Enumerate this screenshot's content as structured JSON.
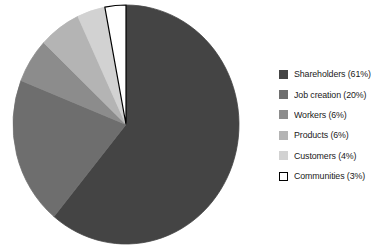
{
  "chart_data": {
    "type": "pie",
    "title": "",
    "subtitle": "",
    "xlabel": "",
    "ylabel": "",
    "legend_position": "right",
    "grid": false,
    "start_angle_deg": 0,
    "direction": "clockwise",
    "categories": [
      "Shareholders",
      "Job creation",
      "Workers",
      "Products",
      "Customers",
      "Communities"
    ],
    "values": [
      61,
      20,
      6,
      6,
      4,
      3
    ],
    "unit": "%",
    "slices": [
      {
        "label": "Shareholders",
        "value": 61,
        "legend_text": "Shareholders (61%)",
        "color": "#444444",
        "outline": "#444444"
      },
      {
        "label": "Job creation",
        "value": 20,
        "legend_text": "Job creation (20%)",
        "color": "#6e6e6e",
        "outline": "#6e6e6e"
      },
      {
        "label": "Workers",
        "value": 6,
        "legend_text": "Workers (6%)",
        "color": "#8c8c8c",
        "outline": "#8c8c8c"
      },
      {
        "label": "Products",
        "value": 6,
        "legend_text": "Products (6%)",
        "color": "#b4b4b4",
        "outline": "#b4b4b4"
      },
      {
        "label": "Customers",
        "value": 4,
        "legend_text": "Customers (4%)",
        "color": "#d2d2d2",
        "outline": "#d2d2d2"
      },
      {
        "label": "Communities",
        "value": 3,
        "legend_text": "Communities (3%)",
        "color": "#ffffff",
        "outline": "#000000"
      }
    ]
  },
  "legend": {
    "items": [
      {
        "label": "Shareholders (61%)"
      },
      {
        "label": "Job creation (20%)"
      },
      {
        "label": "Workers (6%)"
      },
      {
        "label": "Products (6%)"
      },
      {
        "label": "Customers (4%)"
      },
      {
        "label": "Communities (3%)"
      }
    ]
  }
}
